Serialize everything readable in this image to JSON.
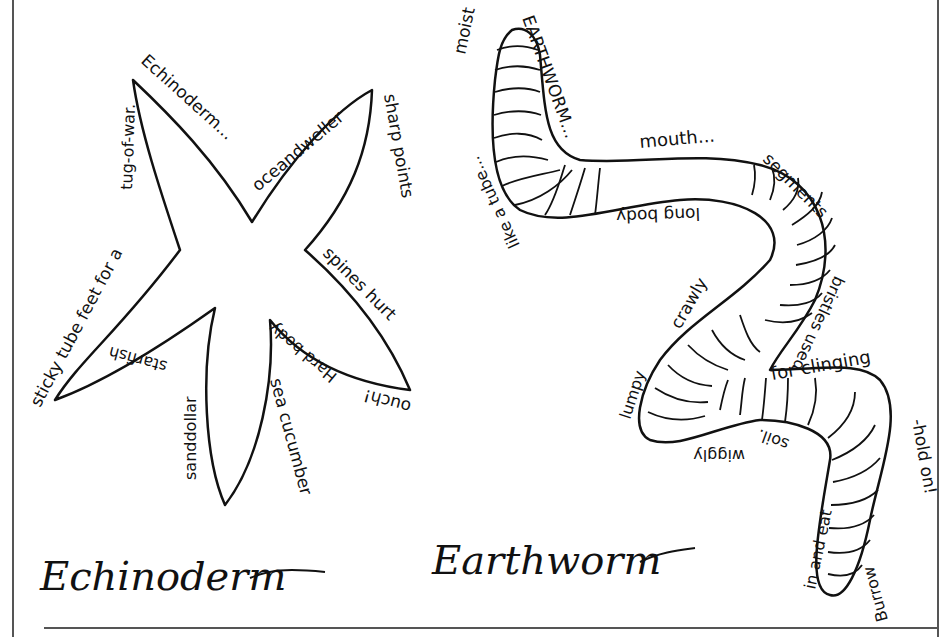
{
  "worksheet": {
    "colors": {
      "ink": "#111111",
      "frame": "#555555",
      "paper": "#ffffff"
    },
    "echinoderm": {
      "caption": "Echinoderm",
      "words": {
        "echinoderm": "Echinoderm...",
        "oceandweller": "oceandweller",
        "sharp_points": "sharp points",
        "spines_hurt": "spines hurt",
        "ouch": "ouch!",
        "hard_body": "Hard body",
        "sea_cucumber": "sea cucumber",
        "sand_dollar": "sanddollar",
        "starfish": "starfish",
        "sticky_tube_feet": "sticky tube feet for a",
        "tug_of_war": "tug-of-war."
      }
    },
    "earthworm": {
      "caption": "Earthworm",
      "words": {
        "moist": "moist",
        "earthworm": "EARTHWORM...",
        "mouth": "mouth...",
        "segments": "segments",
        "bristles_used": "bristles used",
        "for_clinging": "for clinging",
        "hold_on": "-hold on!",
        "burrow": "Burrow",
        "in_and_eat": "in and eat",
        "soil": "soil.",
        "wiggly": "wiggly",
        "lumpy": "lumpy",
        "crawly": "crawly",
        "long_body": "long body",
        "like_a_tube": "like a tube..."
      }
    }
  }
}
